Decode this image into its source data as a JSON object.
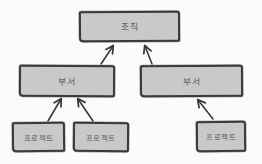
{
  "diagram": {
    "type": "org-hierarchy",
    "style": "hand-drawn-sketch",
    "colors": {
      "background": "#fbfbfa",
      "box_fill": "#c9c9c9",
      "box_border": "#3a3a3a",
      "arrow": "#3a3a3a",
      "text": "#5f5f5f"
    },
    "nodes": [
      {
        "id": "org",
        "label": "조직",
        "level": 1
      },
      {
        "id": "dept-left",
        "label": "부서",
        "level": 2
      },
      {
        "id": "dept-right",
        "label": "부서",
        "level": 2
      },
      {
        "id": "proj-1",
        "label": "프로젝트",
        "level": 3
      },
      {
        "id": "proj-2",
        "label": "프로젝트",
        "level": 3
      },
      {
        "id": "proj-3",
        "label": "프로젝트",
        "level": 3
      }
    ],
    "edges": [
      {
        "from": "dept-left",
        "to": "org"
      },
      {
        "from": "dept-right",
        "to": "org"
      },
      {
        "from": "proj-1",
        "to": "dept-left"
      },
      {
        "from": "proj-2",
        "to": "dept-left"
      },
      {
        "from": "proj-3",
        "to": "dept-right"
      }
    ]
  }
}
